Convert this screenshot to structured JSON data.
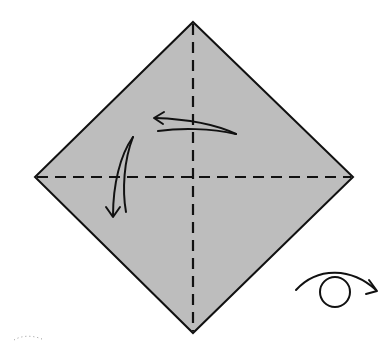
{
  "diagram": {
    "type": "origami-instruction-step",
    "colors": {
      "paper_fill": "#bdbdbd",
      "line": "#111111",
      "background": "#ffffff"
    },
    "square": {
      "shape": "diamond",
      "top": [
        193,
        22
      ],
      "right": [
        353,
        177
      ],
      "bottom": [
        193,
        333
      ],
      "left": [
        35,
        177
      ]
    },
    "crease_lines": [
      {
        "name": "vertical-valley-fold",
        "style": "dashed"
      },
      {
        "name": "horizontal-valley-fold",
        "style": "dashed"
      }
    ],
    "arrows": [
      {
        "name": "fold-left-arrow",
        "direction": "left"
      },
      {
        "name": "fold-down-arrow",
        "direction": "down"
      }
    ],
    "symbols": [
      {
        "name": "turn-over-symbol",
        "meaning": "turn over"
      }
    ],
    "labels": {
      "title": "Origami step: fold in half both ways, then turn over"
    }
  }
}
